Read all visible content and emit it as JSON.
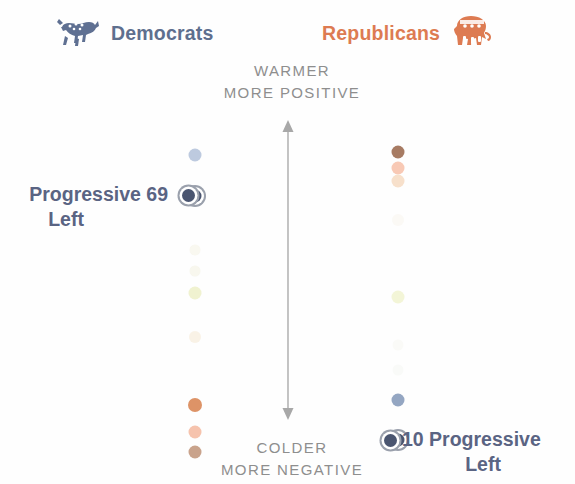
{
  "legend": {
    "democrats": {
      "label": "Democrats",
      "icon": "donkey-icon",
      "color": "#5e6f8e"
    },
    "republicans": {
      "label": "Republicans",
      "icon": "elephant-icon",
      "color": "#dd7b52"
    }
  },
  "axis": {
    "top_line1": "WARMER",
    "top_line2": "MORE POSITIVE",
    "bottom_line1": "COLDER",
    "bottom_line2": "MORE NEGATIVE",
    "arrow": "double-headed-vertical-arrow",
    "text_color": "#8e8e8e"
  },
  "callouts": {
    "left": {
      "line1": "Progressive  69",
      "line2": "Left",
      "group": "Progressive Left",
      "value": 69,
      "party": "Democrats",
      "color": "#5a6483"
    },
    "right": {
      "line1": "10  Progressive",
      "line2": "Left",
      "group": "Progressive Left",
      "value": 10,
      "party": "Republicans",
      "color": "#5a6483"
    }
  },
  "chart_data": {
    "type": "scatter",
    "title": "",
    "xlabel": "",
    "ylabel": "Feeling thermometer rating",
    "ylim": [
      0,
      100
    ],
    "axis_annotations": {
      "top": [
        "WARMER",
        "MORE POSITIVE"
      ],
      "bottom": [
        "COLDER",
        "MORE NEGATIVE"
      ]
    },
    "categories": [
      "Democrats",
      "Republicans"
    ],
    "series": [
      {
        "name": "Democrats",
        "color": "#5e6f8e",
        "points": [
          {
            "label": "Establishment Liberals",
            "y": 155,
            "value": 76,
            "color": "#b9c7dd",
            "size": 13,
            "opacity": 0.95,
            "highlight": false
          },
          {
            "label": "Progressive Left",
            "y": 196,
            "value": 69,
            "color": "#4a5570",
            "size": 13,
            "opacity": 1,
            "highlight": true
          },
          {
            "label": "Democratic Mainstays",
            "y": 250,
            "value": 60,
            "color": "#f3f1e2",
            "size": 11,
            "opacity": 0.5,
            "highlight": false
          },
          {
            "label": "Outsider Left",
            "y": 271,
            "value": 56,
            "color": "#f2efdd",
            "size": 11,
            "opacity": 0.5,
            "highlight": false
          },
          {
            "label": "Stressed Sideliners",
            "y": 293,
            "value": 52,
            "color": "#edf0c8",
            "size": 13,
            "opacity": 0.85,
            "highlight": false
          },
          {
            "label": "Ambivalent Right",
            "y": 337,
            "value": 44,
            "color": "#f7eddc",
            "size": 12,
            "opacity": 0.7,
            "highlight": false
          },
          {
            "label": "Populist Right",
            "y": 405,
            "value": 32,
            "color": "#dd9367",
            "size": 14,
            "opacity": 1,
            "highlight": false
          },
          {
            "label": "Committed Conservatives",
            "y": 432,
            "value": 27,
            "color": "#f6c3ad",
            "size": 13,
            "opacity": 1,
            "highlight": false
          },
          {
            "label": "Faith and Flag Conservatives",
            "y": 452,
            "value": 23,
            "color": "#c9a38c",
            "size": 13,
            "opacity": 1,
            "highlight": false
          }
        ]
      },
      {
        "name": "Republicans",
        "color": "#dd7b52",
        "points": [
          {
            "label": "Faith and Flag Conservatives",
            "y": 152,
            "value": 77,
            "color": "#a77b63",
            "size": 13,
            "opacity": 1,
            "highlight": false
          },
          {
            "label": "Committed Conservatives",
            "y": 168,
            "value": 74,
            "color": "#f8c9b5",
            "size": 13,
            "opacity": 1,
            "highlight": false
          },
          {
            "label": "Populist Right",
            "y": 181,
            "value": 71,
            "color": "#f7e0cb",
            "size": 13,
            "opacity": 1,
            "highlight": false
          },
          {
            "label": "Ambivalent Right",
            "y": 220,
            "value": 64,
            "color": "#f8f4ea",
            "size": 12,
            "opacity": 0.45,
            "highlight": false
          },
          {
            "label": "Stressed Sideliners",
            "y": 297,
            "value": 50,
            "color": "#f0f2cd",
            "size": 13,
            "opacity": 0.8,
            "highlight": false
          },
          {
            "label": "Outsider Left",
            "y": 345,
            "value": 41,
            "color": "#f6f6ee",
            "size": 11,
            "opacity": 0.4,
            "highlight": false
          },
          {
            "label": "Democratic Mainstays",
            "y": 370,
            "value": 37,
            "color": "#f2f4ef",
            "size": 11,
            "opacity": 0.4,
            "highlight": false
          },
          {
            "label": "Establishment Liberals",
            "y": 400,
            "value": 31,
            "color": "#94a6c2",
            "size": 13,
            "opacity": 1,
            "highlight": false
          },
          {
            "label": "Progressive Left",
            "y": 440,
            "value": 10,
            "color": "#4a5570",
            "size": 13,
            "opacity": 1,
            "highlight": true
          }
        ]
      }
    ]
  }
}
